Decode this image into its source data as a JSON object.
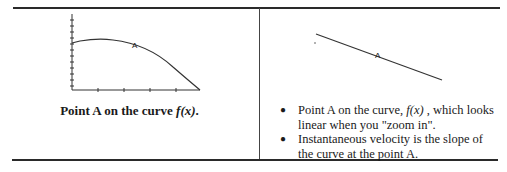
{
  "left_panel": {
    "graph": {
      "description": "concave-down curve f(x) with point A marked",
      "point_label": "A"
    },
    "caption": {
      "prefix": "Point A on the curve ",
      "func": "f(x)",
      "suffix": "."
    }
  },
  "right_panel": {
    "graph": {
      "description": "zoomed-in view of curve near A appearing linear",
      "point_label": "A"
    },
    "bullets": [
      {
        "part1": "Point A on the curve, ",
        "func": "f(x)",
        "part2": " , which looks linear when you \"zoom in\"."
      },
      {
        "text": "Instantaneous velocity is the slope of the curve at the point A."
      }
    ],
    "bullet_glyph": "●"
  }
}
